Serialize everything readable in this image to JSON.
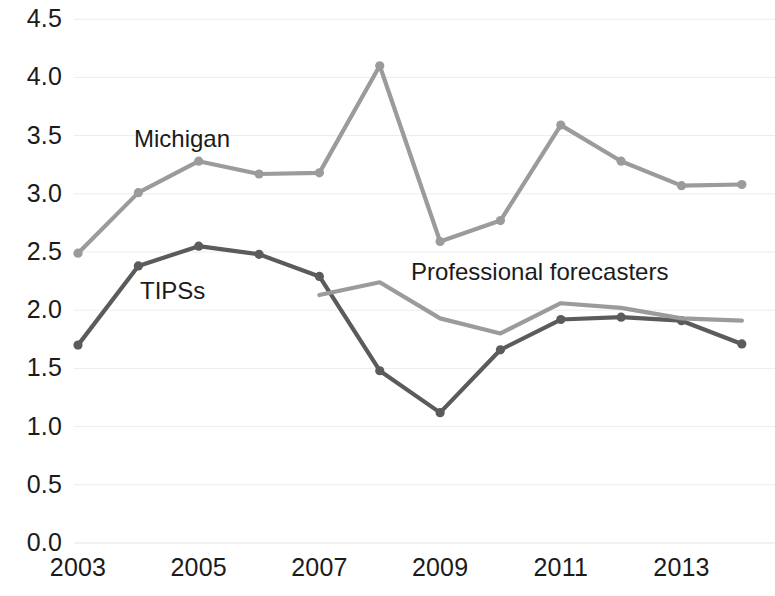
{
  "chart_data": {
    "type": "line",
    "title": "",
    "xlabel": "",
    "ylabel": "",
    "x": [
      2003,
      2004,
      2005,
      2006,
      2007,
      2008,
      2009,
      2010,
      2011,
      2012,
      2013,
      2014
    ],
    "xlim": [
      2002.7,
      2014.3
    ],
    "ylim": [
      0.0,
      4.5
    ],
    "grid": true,
    "legend_position": "inline-annotations",
    "y_ticks": [
      "0.0",
      "0.5",
      "1.0",
      "1.5",
      "2.0",
      "2.5",
      "3.0",
      "3.5",
      "4.0",
      "4.5"
    ],
    "y_tick_values": [
      0.0,
      0.5,
      1.0,
      1.5,
      2.0,
      2.5,
      3.0,
      3.5,
      4.0,
      4.5
    ],
    "x_ticks": [
      "2003",
      "2005",
      "2007",
      "2009",
      "2011",
      "2013"
    ],
    "x_tick_values": [
      2003,
      2005,
      2007,
      2009,
      2011,
      2013
    ],
    "series": [
      {
        "name": "Michigan",
        "color": "#9b9b9b",
        "x": [
          2003,
          2004,
          2005,
          2006,
          2007,
          2008,
          2009,
          2010,
          2011,
          2012,
          2013,
          2014
        ],
        "values": [
          2.49,
          3.01,
          3.28,
          3.17,
          3.18,
          4.1,
          2.59,
          2.77,
          3.59,
          3.28,
          3.07,
          3.08
        ],
        "markers": true
      },
      {
        "name": "TIPSs",
        "color": "#5b5b5b",
        "x": [
          2003,
          2004,
          2005,
          2006,
          2007,
          2008,
          2009,
          2010,
          2011,
          2012,
          2013,
          2014
        ],
        "values": [
          1.7,
          2.38,
          2.55,
          2.48,
          2.29,
          1.48,
          1.12,
          1.66,
          1.92,
          1.94,
          1.91,
          1.71
        ],
        "markers": true
      },
      {
        "name": "Professional forecasters",
        "color": "#9b9b9b",
        "x": [
          2007,
          2008,
          2009,
          2010,
          2011,
          2012,
          2013,
          2014
        ],
        "values": [
          2.13,
          2.24,
          1.93,
          1.8,
          2.06,
          2.02,
          1.93,
          1.91
        ],
        "markers": false
      }
    ],
    "annotations": [
      {
        "text": "Michigan",
        "x": 2005.0,
        "y": 3.6
      },
      {
        "text": "TIPSs",
        "x": 2005.1,
        "y": 2.3
      },
      {
        "text": "Professional forecasters",
        "x": 2007.5,
        "y": 2.45
      }
    ]
  },
  "axes": {
    "y_labels": [
      "4.5",
      "4.0",
      "3.5",
      "3.0",
      "2.5",
      "2.0",
      "1.5",
      "1.0",
      "0.5",
      "0.0"
    ],
    "x_labels": [
      "2003",
      "2005",
      "2007",
      "2009",
      "2011",
      "2013"
    ]
  },
  "annotations": {
    "michigan": "Michigan",
    "tipss": "TIPSs",
    "professional_forecasters": "Professional forecasters"
  },
  "colors": {
    "light_series": "#9b9b9b",
    "dark_series": "#5b5b5b",
    "gridline": "#ececec",
    "text": "#1b1b1b",
    "background": "#ffffff"
  }
}
